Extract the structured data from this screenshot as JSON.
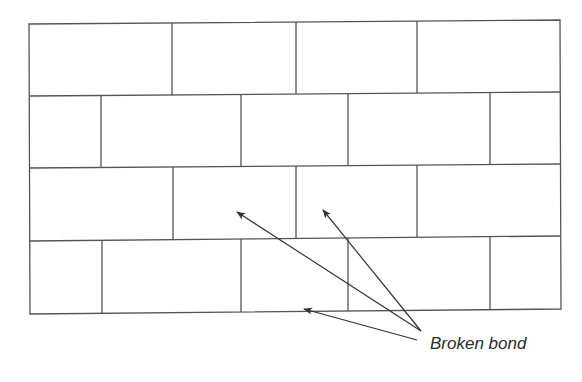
{
  "diagram": {
    "annotation": {
      "text": "Broken bond",
      "x": 430,
      "y": 334
    },
    "colors": {
      "stroke": "#555555",
      "arrow": "#333333",
      "text": "#2a2a2a",
      "background": "#ffffff"
    },
    "frame": {
      "top_left": [
        29,
        24
      ],
      "top_right": [
        560,
        20
      ],
      "bottom_left": [
        30,
        314
      ],
      "bottom_right": [
        561,
        309
      ]
    },
    "courses": [
      {
        "name": "course-1",
        "y_top": [
          24,
          20
        ],
        "y_bottom": [
          96,
          92
        ],
        "joints_x": [
          172,
          296,
          417
        ]
      },
      {
        "name": "course-2",
        "y_top": [
          96,
          92
        ],
        "y_bottom": [
          168,
          164
        ],
        "joints_x": [
          101,
          241,
          348,
          490
        ]
      },
      {
        "name": "course-3",
        "y_top": [
          168,
          164
        ],
        "y_bottom": [
          241,
          236
        ],
        "joints_x": [
          173,
          296,
          417
        ]
      },
      {
        "name": "course-4",
        "y_top": [
          241,
          236
        ],
        "y_bottom": [
          314,
          309
        ],
        "joints_x": [
          102,
          241,
          348,
          490
        ]
      }
    ],
    "arrows": [
      {
        "name": "arrow-to-course-3-left",
        "from": [
          421,
          331
        ],
        "to": [
          237,
          212
        ]
      },
      {
        "name": "arrow-to-course-3-right",
        "from": [
          421,
          331
        ],
        "to": [
          323,
          210
        ]
      },
      {
        "name": "arrow-to-course-4-bottom",
        "from": [
          417,
          340
        ],
        "to": [
          304,
          309
        ]
      }
    ]
  }
}
